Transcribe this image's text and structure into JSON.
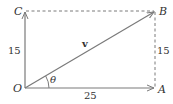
{
  "diagram": {
    "type": "vector-components",
    "colors": {
      "line": "#7a7a7a",
      "text": "#333333",
      "background": "#ffffff"
    },
    "points": {
      "O": {
        "label": "O"
      },
      "A": {
        "label": "A"
      },
      "B": {
        "label": "B"
      },
      "C": {
        "label": "C"
      }
    },
    "vector": {
      "label": "v"
    },
    "angle": {
      "label": "θ"
    },
    "lengths": {
      "left": "15",
      "right": "15",
      "bottom": "25"
    }
  }
}
